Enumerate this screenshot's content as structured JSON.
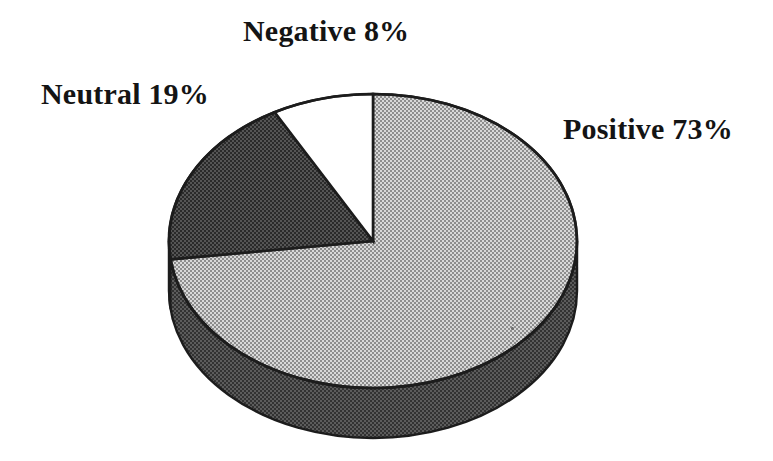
{
  "figure": {
    "background_color": "#ffffff",
    "title": "",
    "style": "scanned halftone 3-D pie chart"
  },
  "labels": {
    "negative": "Negative 8%",
    "neutral": "Neutral 19%",
    "positive": "Positive 73%"
  },
  "colors": {
    "positive_fill": "#b9b9b9",
    "neutral_fill": "#3b3b3b",
    "negative_fill": "#ffffff",
    "side_wall": "#3b3b3b",
    "outline": "#1c1c1c",
    "text": "#141414"
  },
  "geometry": {
    "center_x": 373,
    "center_y": 241,
    "radius_x": 204,
    "radius_y": 147,
    "depth": 50
  },
  "chart_data": {
    "type": "pie",
    "title": "",
    "categories": [
      "Positive",
      "Neutral",
      "Negative"
    ],
    "values": [
      73,
      19,
      8
    ],
    "units": "%",
    "labels": [
      "Positive 73%",
      "Neutral 19%",
      "Negative 8%"
    ],
    "label_positions": [
      "right",
      "left",
      "top"
    ],
    "colors": [
      "#b9b9b9",
      "#3b3b3b",
      "#ffffff"
    ],
    "start_angle_deg": 0,
    "direction": "clockwise",
    "three_d": true,
    "legend": "none",
    "grid": false,
    "slices": [
      {
        "name": "Positive",
        "value": 73,
        "label": "Positive 73%",
        "fill": "#b9b9b9",
        "start_deg": 0.0,
        "end_deg": 262.8
      },
      {
        "name": "Neutral",
        "value": 19,
        "label": "Neutral 19%",
        "fill": "#3b3b3b",
        "start_deg": 262.8,
        "end_deg": 331.2
      },
      {
        "name": "Negative",
        "value": 8,
        "label": "Negative 8%",
        "fill": "#ffffff",
        "start_deg": 331.2,
        "end_deg": 360.0
      }
    ]
  }
}
